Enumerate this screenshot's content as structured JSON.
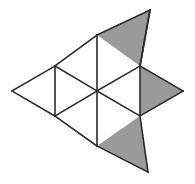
{
  "figure": {
    "shape_kind": "triangular-lattice-polyiamond",
    "total_triangles": 9,
    "shaded_triangles": 3,
    "unshaded_triangles": 6,
    "colors": {
      "shaded_fill": "#9a9a9a",
      "unshaded_fill": "#ffffff",
      "line": "#2b2b2b",
      "background": "#ffffff"
    },
    "line_width": 1.6,
    "lattice": {
      "side_length": 85,
      "row_height": 55,
      "points": {
        "left": [
          12,
          91
        ],
        "upper_left": [
          55,
          66
        ],
        "lower_left": [
          55,
          116
        ],
        "top": [
          97,
          35
        ],
        "center": [
          97,
          91
        ],
        "bottom": [
          97,
          146
        ],
        "upper_right": [
          140,
          66
        ],
        "lower_right": [
          140,
          116
        ],
        "apex_top": [
          150,
          10
        ],
        "right_tip": [
          183,
          91
        ],
        "apex_bottom": [
          148,
          172
        ]
      }
    },
    "cells": [
      {
        "id": "cell-left-upper",
        "label": "left upper triangle",
        "shaded": false,
        "orientation": "down",
        "points": "12,91 55,66 55,116"
      },
      {
        "id": "cell-upper-left-inner",
        "label": "upper left inner triangle",
        "shaded": false,
        "orientation": "up",
        "points": "55,66 97,91 55,116"
      },
      {
        "id": "cell-top-left",
        "label": "top left triangle",
        "shaded": false,
        "orientation": "down",
        "points": "55,66 97,35 97,91"
      },
      {
        "id": "cell-center-upper",
        "label": "center upper triangle",
        "shaded": false,
        "orientation": "up",
        "points": "97,35 140,66 97,91"
      },
      {
        "id": "cell-center-lower",
        "label": "center lower triangle",
        "shaded": false,
        "orientation": "down",
        "points": "97,91 140,116 97,146"
      },
      {
        "id": "cell-lower-left-inner",
        "label": "lower left inner triangle",
        "shaded": false,
        "orientation": "up",
        "points": "55,116 97,91 97,146"
      },
      {
        "id": "cell-top-right-shaded",
        "label": "top right shaded triangle",
        "shaded": true,
        "orientation": "up",
        "points": "97,35 150,10 140,66"
      },
      {
        "id": "cell-right-shaded",
        "label": "right shaded triangle",
        "shaded": true,
        "orientation": "right",
        "points": "140,66 183,91 140,116"
      },
      {
        "id": "cell-bottom-right-shaded",
        "label": "bottom right shaded triangle",
        "shaded": true,
        "orientation": "down",
        "points": "97,146 140,116 148,172"
      }
    ],
    "edges": [
      {
        "id": "edge-outer-left-top",
        "points": "12,91 55,66"
      },
      {
        "id": "edge-upper-left-rise",
        "points": "55,66 97,35"
      },
      {
        "id": "edge-top-to-apex",
        "points": "97,35 150,10"
      },
      {
        "id": "edge-apex-down-right",
        "points": "150,10 140,66"
      },
      {
        "id": "edge-upper-right-to-tip",
        "points": "140,66 183,91"
      },
      {
        "id": "edge-tip-to-lower-right",
        "points": "183,91 140,116"
      },
      {
        "id": "edge-lower-right-to-bottom-apex",
        "points": "140,116 148,172"
      },
      {
        "id": "edge-bottom-apex-to-bottom",
        "points": "148,172 97,146"
      },
      {
        "id": "edge-bottom-to-lower-left",
        "points": "97,146 55,116"
      },
      {
        "id": "edge-outer-left-bottom",
        "points": "55,116 12,91"
      },
      {
        "id": "edge-vertical-left",
        "points": "55,66 55,116"
      },
      {
        "id": "edge-vertical-center-upper",
        "points": "97,35 97,91"
      },
      {
        "id": "edge-vertical-center-lower",
        "points": "97,91 97,146"
      },
      {
        "id": "edge-vertical-right-upper",
        "points": "140,66 140,116"
      },
      {
        "id": "edge-diag-left-center",
        "points": "55,66 97,91"
      },
      {
        "id": "edge-diag-center-lowerleft",
        "points": "97,91 55,116"
      },
      {
        "id": "edge-diag-center-upperright",
        "points": "97,91 140,66"
      },
      {
        "id": "edge-diag-center-lowerright",
        "points": "97,91 140,116"
      },
      {
        "id": "edge-vertical-apex-top-stub",
        "points": "150,10 140,66"
      }
    ]
  }
}
